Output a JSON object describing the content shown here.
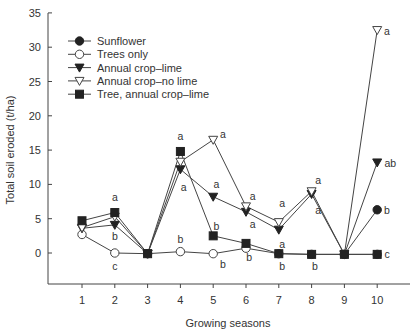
{
  "chart_data": {
    "type": "line",
    "title": "",
    "xlabel": "Growing seasons",
    "ylabel": "Total soil eroded (t/ha)",
    "x": [
      1,
      2,
      3,
      4,
      5,
      6,
      7,
      8,
      9,
      10
    ],
    "xticks": [
      "1",
      "2",
      "3",
      "4",
      "5",
      "6",
      "7",
      "8",
      "9",
      "10"
    ],
    "yticks": [
      "0",
      "5",
      "10",
      "15",
      "20",
      "25",
      "30",
      "35"
    ],
    "ylim": [
      -4.5,
      35
    ],
    "xlim": [
      0.0,
      11
    ],
    "grid": false,
    "legend_position": "top-left",
    "series": [
      {
        "name": "Sunflower",
        "marker": "filled-circle",
        "x": [
          9,
          10
        ],
        "values": [
          -0.2,
          6.3
        ]
      },
      {
        "name": "Trees only",
        "marker": "open-circle",
        "x": [
          1,
          2,
          3,
          4,
          5,
          6,
          7,
          8,
          9,
          10
        ],
        "values": [
          2.7,
          0.0,
          -0.1,
          0.2,
          -0.1,
          0.7,
          -0.1,
          -0.2,
          -0.2,
          -0.2
        ]
      },
      {
        "name": "Annual crop–lime",
        "marker": "filled-triangle-down",
        "x": [
          1,
          2,
          3,
          4,
          5,
          6,
          7,
          8,
          9,
          10
        ],
        "values": [
          3.6,
          4.1,
          -0.1,
          12.2,
          8.2,
          6.0,
          3.4,
          8.6,
          -0.2,
          13.2
        ]
      },
      {
        "name": "Annual crop–no lime",
        "marker": "open-triangle-down",
        "x": [
          1,
          2,
          3,
          4,
          5,
          6,
          7,
          8,
          9,
          10
        ],
        "values": [
          3.7,
          5.3,
          -0.1,
          13.3,
          16.5,
          6.8,
          4.5,
          9.0,
          -0.2,
          32.5
        ]
      },
      {
        "name": "Tree, annual crop–lime",
        "marker": "filled-square",
        "x": [
          1,
          2,
          3,
          4,
          5,
          6,
          7,
          8,
          9,
          10
        ],
        "values": [
          4.7,
          5.9,
          -0.1,
          14.8,
          2.5,
          1.4,
          -0.1,
          -0.2,
          -0.2,
          -0.2
        ]
      }
    ],
    "annotations": [
      {
        "text": "a",
        "x": 2,
        "y": 8.1
      },
      {
        "text": "b",
        "x": 2,
        "y": 2.5
      },
      {
        "text": "c",
        "x": 2,
        "y": -1.9
      },
      {
        "text": "a",
        "x": 4,
        "y": 17.0
      },
      {
        "text": "a",
        "x": 4.1,
        "y": 9.6
      },
      {
        "text": "b",
        "x": 4,
        "y": 2.0
      },
      {
        "text": "a",
        "x": 5.3,
        "y": 17.3
      },
      {
        "text": "a",
        "x": 5.1,
        "y": 10.0
      },
      {
        "text": "b",
        "x": 5.1,
        "y": 4.0
      },
      {
        "text": "b",
        "x": 5.3,
        "y": -1.6
      },
      {
        "text": "a",
        "x": 6.2,
        "y": 8.3
      },
      {
        "text": "a",
        "x": 6.2,
        "y": 4.2
      },
      {
        "text": "b",
        "x": 6.1,
        "y": -0.6
      },
      {
        "text": "a",
        "x": 7.1,
        "y": 7.3
      },
      {
        "text": "a",
        "x": 7.1,
        "y": 1.3
      },
      {
        "text": "b",
        "x": 7.1,
        "y": -1.9
      },
      {
        "text": "a",
        "x": 8.2,
        "y": 10.6
      },
      {
        "text": "a",
        "x": 8.2,
        "y": 6.3
      },
      {
        "text": "b",
        "x": 8.1,
        "y": -1.9
      },
      {
        "text": "a",
        "x": 10.3,
        "y": 32.4
      },
      {
        "text": "ab",
        "x": 10.4,
        "y": 13.1
      },
      {
        "text": "b",
        "x": 10.3,
        "y": 6.2
      },
      {
        "text": "c",
        "x": 10.3,
        "y": -0.2
      }
    ]
  }
}
